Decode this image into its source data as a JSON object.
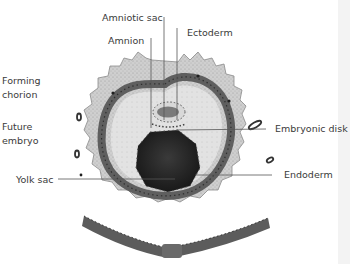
{
  "diagram": {
    "type": "embryology-illustration",
    "colors": {
      "chorion": "#c8c8c8",
      "cell_layer": "#6e6e6e",
      "cavity": "#e4e4e4",
      "yolk_sac": "#2a2a2a",
      "amniotic_sac": "#7a7a7a",
      "leader_line": "#555555",
      "text": "#3a3a3a"
    },
    "labels": {
      "amniotic_sac": "Amniotic sac",
      "amnion": "Amnion",
      "ectoderm": "Ectoderm",
      "forming_chorion_line1": "Forming",
      "forming_chorion_line2": "chorion",
      "future_embryo_line1": "Future",
      "future_embryo_line2": "embryo",
      "embryonic_disk": "Embryonic disk",
      "yolk_sac": "Yolk sac",
      "endoderm": "Endoderm"
    }
  }
}
